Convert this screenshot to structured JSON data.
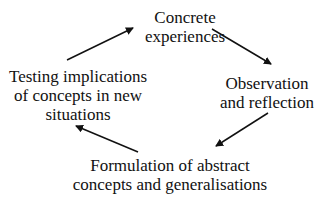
{
  "diagram": {
    "type": "cycle",
    "nodes": [
      {
        "id": "concrete",
        "lines": [
          "Concrete",
          "experiences"
        ]
      },
      {
        "id": "observation",
        "lines": [
          "Observation",
          "and reflection"
        ]
      },
      {
        "id": "formulation",
        "lines": [
          "Formulation of abstract",
          "concepts and generalisations"
        ]
      },
      {
        "id": "testing",
        "lines": [
          "Testing implications",
          "of concepts in new",
          "situations"
        ]
      }
    ],
    "edges": [
      {
        "from": "testing",
        "to": "concrete"
      },
      {
        "from": "concrete",
        "to": "observation"
      },
      {
        "from": "observation",
        "to": "formulation"
      },
      {
        "from": "formulation",
        "to": "testing"
      }
    ],
    "colors": {
      "text": "#111111",
      "arrow": "#111111",
      "background": "#ffffff"
    }
  }
}
